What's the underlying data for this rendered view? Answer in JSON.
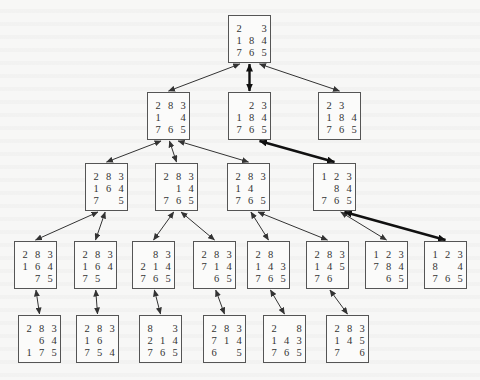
{
  "diagram": {
    "title": "",
    "type": "8-puzzle search tree",
    "box_size": {
      "w": 43,
      "h": 48
    },
    "colors": {
      "background": "#f7f7f6",
      "box_border": "#555555",
      "text": "#333333",
      "edge": "#333333",
      "solution_edge": "#111111"
    },
    "nodes": [
      {
        "id": "n0",
        "row": 0,
        "x": 228,
        "y": 15,
        "tiles": [
          "2",
          "",
          "3",
          "1",
          "8",
          "4",
          "7",
          "6",
          "5"
        ]
      },
      {
        "id": "n1",
        "row": 1,
        "x": 147,
        "y": 92,
        "tiles": [
          "2",
          "8",
          "3",
          "1",
          "",
          "4",
          "7",
          "6",
          "5"
        ]
      },
      {
        "id": "n2",
        "row": 1,
        "x": 228,
        "y": 92,
        "tiles": [
          "",
          "2",
          "3",
          "1",
          "8",
          "4",
          "7",
          "6",
          "5"
        ]
      },
      {
        "id": "n3",
        "row": 1,
        "x": 318,
        "y": 92,
        "tiles": [
          "2",
          "3",
          "",
          "1",
          "8",
          "4",
          "7",
          "6",
          "5"
        ]
      },
      {
        "id": "n4",
        "row": 2,
        "x": 85,
        "y": 163,
        "tiles": [
          "2",
          "8",
          "3",
          "1",
          "6",
          "4",
          "7",
          "",
          "5"
        ]
      },
      {
        "id": "n5",
        "row": 2,
        "x": 155,
        "y": 163,
        "tiles": [
          "2",
          "8",
          "3",
          "",
          "1",
          "4",
          "7",
          "6",
          "5"
        ]
      },
      {
        "id": "n6",
        "row": 2,
        "x": 227,
        "y": 163,
        "tiles": [
          "2",
          "8",
          "3",
          "1",
          "4",
          "",
          "7",
          "6",
          "5"
        ]
      },
      {
        "id": "n7",
        "row": 2,
        "x": 313,
        "y": 163,
        "tiles": [
          "1",
          "2",
          "3",
          "",
          "8",
          "4",
          "7",
          "6",
          "5"
        ]
      },
      {
        "id": "n8",
        "row": 3,
        "x": 14,
        "y": 241,
        "tiles": [
          "2",
          "8",
          "3",
          "1",
          "6",
          "4",
          "",
          "7",
          "5"
        ]
      },
      {
        "id": "n9",
        "row": 3,
        "x": 74,
        "y": 241,
        "tiles": [
          "2",
          "8",
          "3",
          "1",
          "6",
          "4",
          "7",
          "5",
          ""
        ]
      },
      {
        "id": "n10",
        "row": 3,
        "x": 132,
        "y": 241,
        "tiles": [
          "",
          "8",
          "3",
          "2",
          "1",
          "4",
          "7",
          "6",
          "5"
        ]
      },
      {
        "id": "n11",
        "row": 3,
        "x": 193,
        "y": 241,
        "tiles": [
          "2",
          "8",
          "3",
          "7",
          "1",
          "4",
          "",
          "6",
          "5"
        ]
      },
      {
        "id": "n12",
        "row": 3,
        "x": 247,
        "y": 241,
        "tiles": [
          "2",
          "8",
          "",
          "1",
          "4",
          "3",
          "7",
          "6",
          "5"
        ]
      },
      {
        "id": "n13",
        "row": 3,
        "x": 306,
        "y": 241,
        "tiles": [
          "2",
          "8",
          "3",
          "1",
          "4",
          "5",
          "7",
          "6",
          ""
        ]
      },
      {
        "id": "n14",
        "row": 3,
        "x": 365,
        "y": 241,
        "tiles": [
          "1",
          "2",
          "3",
          "7",
          "8",
          "4",
          "",
          "6",
          "5"
        ]
      },
      {
        "id": "n15",
        "row": 3,
        "x": 424,
        "y": 241,
        "tiles": [
          "1",
          "2",
          "3",
          "8",
          "",
          "4",
          "7",
          "6",
          "5"
        ]
      },
      {
        "id": "n16",
        "row": 4,
        "x": 18,
        "y": 315,
        "tiles": [
          "2",
          "8",
          "3",
          "",
          "6",
          "4",
          "1",
          "7",
          "5"
        ]
      },
      {
        "id": "n17",
        "row": 4,
        "x": 76,
        "y": 315,
        "tiles": [
          "2",
          "8",
          "3",
          "1",
          "6",
          "",
          "7",
          "5",
          "4"
        ]
      },
      {
        "id": "n18",
        "row": 4,
        "x": 139,
        "y": 315,
        "tiles": [
          "8",
          "",
          "3",
          "2",
          "1",
          "4",
          "7",
          "6",
          "5"
        ]
      },
      {
        "id": "n19",
        "row": 4,
        "x": 203,
        "y": 315,
        "tiles": [
          "2",
          "8",
          "3",
          "7",
          "1",
          "4",
          "6",
          "",
          "5"
        ]
      },
      {
        "id": "n20",
        "row": 4,
        "x": 263,
        "y": 315,
        "tiles": [
          "2",
          "",
          "8",
          "1",
          "4",
          "3",
          "7",
          "6",
          "5"
        ]
      },
      {
        "id": "n21",
        "row": 4,
        "x": 326,
        "y": 315,
        "tiles": [
          "2",
          "8",
          "3",
          "1",
          "4",
          "5",
          "7",
          "",
          "6"
        ]
      }
    ],
    "edges": [
      {
        "from": "n0",
        "to": "n1",
        "solution": false
      },
      {
        "from": "n0",
        "to": "n2",
        "solution": true
      },
      {
        "from": "n0",
        "to": "n3",
        "solution": false
      },
      {
        "from": "n1",
        "to": "n4",
        "solution": false
      },
      {
        "from": "n1",
        "to": "n5",
        "solution": false
      },
      {
        "from": "n1",
        "to": "n6",
        "solution": false
      },
      {
        "from": "n2",
        "to": "n7",
        "solution": true
      },
      {
        "from": "n4",
        "to": "n8",
        "solution": false
      },
      {
        "from": "n4",
        "to": "n9",
        "solution": false
      },
      {
        "from": "n5",
        "to": "n10",
        "solution": false
      },
      {
        "from": "n5",
        "to": "n11",
        "solution": false
      },
      {
        "from": "n6",
        "to": "n12",
        "solution": false
      },
      {
        "from": "n6",
        "to": "n13",
        "solution": false
      },
      {
        "from": "n7",
        "to": "n14",
        "solution": false
      },
      {
        "from": "n7",
        "to": "n15",
        "solution": true
      },
      {
        "from": "n8",
        "to": "n16",
        "solution": false
      },
      {
        "from": "n9",
        "to": "n17",
        "solution": false
      },
      {
        "from": "n10",
        "to": "n18",
        "solution": false
      },
      {
        "from": "n11",
        "to": "n19",
        "solution": false
      },
      {
        "from": "n12",
        "to": "n20",
        "solution": false
      },
      {
        "from": "n13",
        "to": "n21",
        "solution": false
      }
    ]
  }
}
